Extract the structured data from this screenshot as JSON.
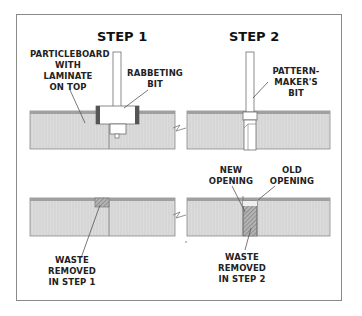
{
  "steps": [
    {
      "title": "STEP 1",
      "labels": {
        "material": "PARTICLEBOARD\nWITH\nLAMINATE\nON TOP",
        "bit": "RABBETING\nBIT",
        "waste": "WASTE\nREMOVED\nIN STEP 1"
      }
    },
    {
      "title": "STEP 2",
      "labels": {
        "bit": "PATTERN-\nMAKER'S\nBIT",
        "new_opening": "NEW\nOPENING",
        "old_opening": "OLD\nOPENING",
        "waste": "WASTE\nREMOVED\nIN STEP 2"
      }
    }
  ],
  "colors": {
    "frame": "#8a8a8a",
    "board_fill": "#d8d8d8",
    "laminate": "#9a9a9a",
    "outline": "#6e6e6e",
    "waste_hatch": "#8c8c8c"
  }
}
